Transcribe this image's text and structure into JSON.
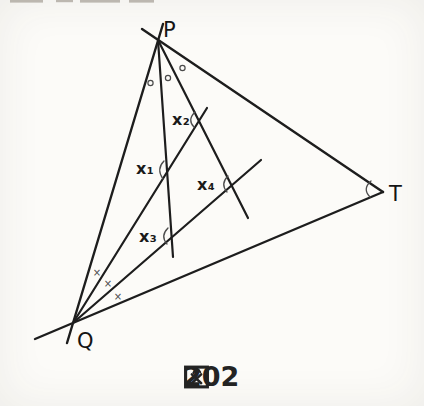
{
  "figure": {
    "type": "geometry-diagram",
    "vertex_labels": {
      "P": "P",
      "Q": "Q",
      "T": "T"
    },
    "angle_labels": {
      "x1": "x₁",
      "x2": "x₂",
      "x3": "x₃",
      "x4": "x₄"
    },
    "equal_angle_marks": {
      "at_P": {
        "symbol": "○",
        "count": 3
      },
      "at_Q": {
        "symbol": "×",
        "count": 3
      }
    },
    "arc_marks_at": [
      "x1",
      "x2",
      "x3",
      "x4",
      "T"
    ],
    "colors": {
      "line": "#1d1d1d",
      "label": "#141414",
      "mark": "#4a4a4a",
      "caption": "#232323",
      "background": "#fcfbf8"
    }
  },
  "caption": {
    "text": "図202",
    "kanji": "図",
    "number": "202"
  },
  "top_strip": {
    "note": "cut-off bottoms of text glyphs from line above, partially cropped"
  }
}
